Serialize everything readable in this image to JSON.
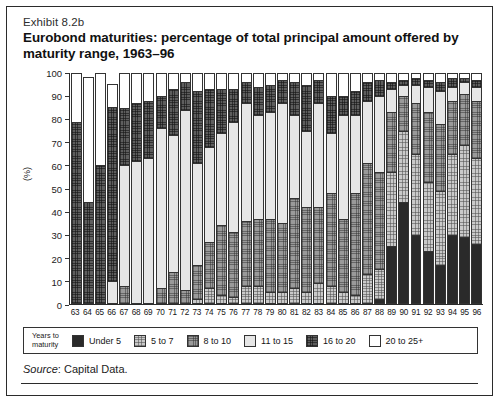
{
  "exhibit": {
    "eyebrow": "Exhibit 8.2b",
    "title": "Eurobond maturities: percentage of total principal amount offered by maturity range, 1963–96",
    "source_label": "Source",
    "source_text": ": Capital Data."
  },
  "legend": {
    "title_line1": "Years to",
    "title_line2": "maturity",
    "items": [
      {
        "label": "Under 5",
        "color": "#2a2a2a"
      },
      {
        "label": "5 to 7",
        "color": "#c9c9c9"
      },
      {
        "label": "8 to 10",
        "color": "#9a9a9a"
      },
      {
        "label": "11 to 15",
        "color": "#e6e6e6"
      },
      {
        "label": "16 to 20",
        "color": "#5e5e5e"
      },
      {
        "label": "20 to 25+",
        "color": "#ffffff"
      }
    ]
  },
  "chart_data": {
    "type": "bar",
    "stacked": true,
    "title": "Eurobond maturities: percentage of total principal amount offered by maturity range, 1963–96",
    "xlabel": "",
    "ylabel": "(%)",
    "ylim": [
      0,
      100
    ],
    "yticks": [
      0,
      10,
      20,
      30,
      40,
      50,
      60,
      70,
      80,
      90,
      100
    ],
    "grid": false,
    "legend_position": "bottom",
    "categories": [
      "63",
      "64",
      "65",
      "66",
      "67",
      "68",
      "69",
      "70",
      "71",
      "72",
      "73",
      "74",
      "75",
      "76",
      "77",
      "78",
      "79",
      "80",
      "81",
      "82",
      "83",
      "84",
      "85",
      "86",
      "87",
      "88",
      "89",
      "90",
      "91",
      "92",
      "93",
      "94",
      "95",
      "96"
    ],
    "series": [
      {
        "name": "Under 5",
        "values": [
          0,
          0,
          0,
          0,
          0,
          0,
          0,
          0,
          0,
          0,
          0,
          0,
          0,
          0,
          0,
          0,
          0,
          0,
          0,
          0,
          0,
          0,
          0,
          0,
          0,
          2,
          25,
          44,
          30,
          23,
          17,
          30,
          29,
          26
        ]
      },
      {
        "name": "5 to 7",
        "values": [
          0,
          0,
          0,
          0,
          0,
          0,
          0,
          0,
          0,
          0,
          2,
          7,
          4,
          3,
          8,
          8,
          5,
          5,
          7,
          5,
          9,
          8,
          5,
          4,
          13,
          13,
          32,
          31,
          35,
          30,
          32,
          35,
          40,
          37
        ]
      },
      {
        "name": "8 to 10",
        "values": [
          0,
          0,
          0,
          0,
          8,
          0,
          0,
          7,
          14,
          6,
          15,
          20,
          30,
          28,
          28,
          29,
          32,
          30,
          39,
          37,
          33,
          40,
          32,
          44,
          48,
          42,
          26,
          15,
          22,
          30,
          29,
          23,
          22,
          25
        ]
      },
      {
        "name": "11 to 15",
        "values": [
          0,
          0,
          0,
          10,
          52,
          62,
          63,
          69,
          59,
          78,
          44,
          41,
          40,
          48,
          51,
          45,
          46,
          52,
          36,
          33,
          45,
          26,
          45,
          34,
          27,
          33,
          10,
          5,
          8,
          11,
          14,
          6,
          5,
          6
        ]
      },
      {
        "name": "16 to 20",
        "values": [
          79,
          44,
          60,
          75,
          25,
          25,
          25,
          14,
          20,
          12,
          31,
          25,
          19,
          14,
          9,
          12,
          12,
          10,
          14,
          20,
          10,
          16,
          8,
          10,
          8,
          7,
          3,
          2,
          3,
          3,
          4,
          4,
          2,
          3
        ]
      },
      {
        "name": "20 to 25+",
        "values": [
          21,
          54,
          40,
          10,
          15,
          13,
          12,
          10,
          7,
          4,
          8,
          7,
          7,
          7,
          4,
          6,
          5,
          3,
          4,
          5,
          3,
          10,
          10,
          8,
          4,
          3,
          4,
          3,
          2,
          3,
          4,
          2,
          2,
          3
        ]
      }
    ]
  }
}
